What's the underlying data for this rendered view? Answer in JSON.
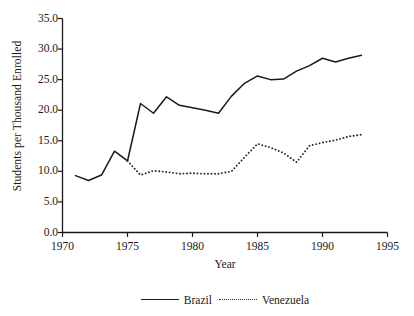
{
  "chart_data": {
    "type": "line",
    "title": "",
    "xlabel": "Year",
    "ylabel": "Students per Thousand Enrolled",
    "xlim": [
      1970,
      1995
    ],
    "ylim": [
      0.0,
      35.0
    ],
    "grid": false,
    "legend_position": "bottom-center",
    "xticks": [
      "1970",
      "1975",
      "1980",
      "1985",
      "1990",
      "1995"
    ],
    "xtick_values": [
      1970,
      1975,
      1980,
      1985,
      1990,
      1995
    ],
    "yticks": [
      "0.0",
      "5.0",
      "10.0",
      "15.0",
      "20.0",
      "25.0",
      "30.0",
      "35.0"
    ],
    "ytick_values": [
      0.0,
      5.0,
      10.0,
      15.0,
      20.0,
      25.0,
      30.0,
      35.0
    ],
    "x": [
      1971,
      1972,
      1973,
      1974,
      1975,
      1976,
      1977,
      1978,
      1979,
      1980,
      1981,
      1982,
      1983,
      1984,
      1985,
      1986,
      1987,
      1988,
      1989,
      1990,
      1991,
      1992,
      1993
    ],
    "series": [
      {
        "name": "Brazil",
        "style": "solid",
        "color": "#1a1a1a",
        "values": [
          9.3,
          8.5,
          9.4,
          13.3,
          11.7,
          21.1,
          19.5,
          22.2,
          20.8,
          20.4,
          20.0,
          19.5,
          22.3,
          24.4,
          25.6,
          25.0,
          25.1,
          26.4,
          27.3,
          28.5,
          27.9,
          28.5,
          29.0
        ]
      },
      {
        "name": "Venezuela",
        "style": "dotted",
        "color": "#2a2a2a",
        "values": [
          null,
          null,
          null,
          null,
          11.7,
          9.4,
          10.1,
          9.9,
          9.6,
          9.7,
          9.6,
          9.6,
          10.0,
          12.3,
          14.5,
          13.9,
          13.0,
          11.5,
          14.2,
          14.7,
          15.1,
          15.7,
          16.0
        ]
      }
    ],
    "legend": [
      {
        "label": "Brazil",
        "style": "solid"
      },
      {
        "label": "Venezuela",
        "style": "dotted"
      }
    ]
  }
}
